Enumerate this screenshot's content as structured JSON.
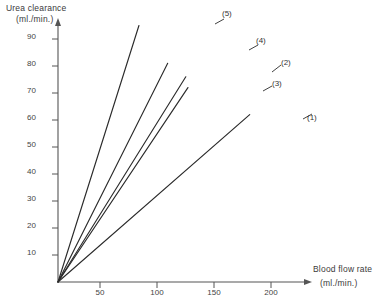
{
  "chart_data": {
    "type": "line",
    "title": "",
    "ylabel": "Urea clearance",
    "ylabel_units": "(ml./min.)",
    "xlabel": "Blood flow rate",
    "xlabel_units": "(ml./min.)",
    "xlim": [
      0,
      215
    ],
    "ylim": [
      0,
      95
    ],
    "grid": false,
    "legend": "inline-end-labels",
    "xticks": [
      50,
      100,
      150,
      200
    ],
    "yticks": [
      10,
      20,
      30,
      40,
      50,
      60,
      70,
      80,
      90
    ],
    "xtick_labels": [
      "50",
      "100",
      "150",
      "200"
    ],
    "ytick_labels": [
      "10",
      "20",
      "30",
      "40",
      "50",
      "60",
      "70",
      "80",
      "90"
    ],
    "series": [
      {
        "name": "(1)",
        "label": "(1)",
        "x": [
          0,
          180
        ],
        "y": [
          0,
          62
        ],
        "slope": 0.344
      },
      {
        "name": "(2)",
        "label": "(2)",
        "x": [
          0,
          120
        ],
        "y": [
          0,
          76
        ],
        "slope": 0.633
      },
      {
        "name": "(3)",
        "label": "(3)",
        "x": [
          0,
          122
        ],
        "y": [
          0,
          72
        ],
        "slope": 0.59
      },
      {
        "name": "(4)",
        "label": "(4)",
        "x": [
          0,
          103
        ],
        "y": [
          0,
          81
        ],
        "slope": 0.786
      },
      {
        "name": "(5)",
        "label": "(5)",
        "x": [
          0,
          76
        ],
        "y": [
          0,
          95
        ],
        "slope": 1.25
      }
    ],
    "colors": {
      "line": "#2b2b2b",
      "axis": "#555555",
      "text": "#3a3a3a"
    }
  }
}
